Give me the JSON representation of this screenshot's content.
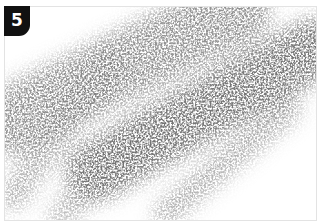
{
  "step_badge": {
    "number": "5",
    "background": "#111111",
    "color": "#ffffff"
  },
  "illustration": {
    "name": "diagonal-pencil-shading",
    "description": "Stippled gray pencil shading strokes running diagonally from lower-left to upper-right",
    "ink_color": "#7a7a7a",
    "border_color": "#e3e3e3",
    "bands": [
      {
        "label": "upper-band",
        "x1": 10,
        "y1": 120,
        "x2": 235,
        "y2": 10,
        "width": 70,
        "opacity": 0.75
      },
      {
        "label": "central-band",
        "x1": 95,
        "y1": 170,
        "x2": 312,
        "y2": 48,
        "width": 62,
        "opacity": 0.95
      },
      {
        "label": "lower-band",
        "x1": 165,
        "y1": 212,
        "x2": 288,
        "y2": 108,
        "width": 26,
        "opacity": 0.6
      },
      {
        "label": "left-stroke",
        "x1": 12,
        "y1": 195,
        "x2": 110,
        "y2": 60,
        "width": 30,
        "opacity": 0.55
      },
      {
        "label": "lower-left-stroke",
        "x1": 60,
        "y1": 215,
        "x2": 150,
        "y2": 120,
        "width": 28,
        "opacity": 0.5
      }
    ]
  }
}
